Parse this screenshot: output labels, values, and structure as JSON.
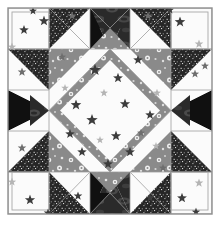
{
  "artwork": {
    "title": "Star Quilt Block",
    "kind": "quilt-block-diagram",
    "width": 220,
    "height": 227,
    "background": "#ffffff"
  },
  "frame": {
    "x": 8,
    "y": 8,
    "width": 204,
    "height": 206,
    "stroke": "#8e8e8e",
    "stroke_width": 1.4,
    "label": "outer-border"
  },
  "grid": {
    "columns": 5,
    "rows": 5,
    "cell_width": 40.8,
    "cell_height": 41.2,
    "origin_x": 8,
    "origin_y": 8,
    "seam_stroke": "#9a9a9a",
    "seam_width": 0.8
  },
  "palette": {
    "white_star_print": "#fbfbfb",
    "gray_floral_print": "#8a8a8a",
    "dark_speckle_print": "#2d2d2d",
    "black_solid": "#111111",
    "charcoal_swirl": "#3a3a3a",
    "seam_line": "#9a9a9a",
    "star_dark": "#3c3c3c",
    "star_mid": "#6e6e6e",
    "star_light": "#b4b4b4",
    "floral_dot": "#f2f2f2"
  },
  "fabrics": [
    {
      "id": "white_star",
      "name": "white-star-print",
      "fill": "#fbfbfb",
      "desc": "white background with scattered gray stars"
    },
    {
      "id": "gray_floral",
      "name": "gray-floral-print",
      "fill": "#8a8a8a",
      "desc": "medium gray with white flower sprigs"
    },
    {
      "id": "dark_speckle",
      "name": "dark-speckle-print",
      "fill": "#2d2d2d",
      "desc": "near-black with fine white speckles"
    },
    {
      "id": "black_solid",
      "name": "black-solid",
      "fill": "#111111",
      "desc": "solid black"
    },
    {
      "id": "charcoal_swirl",
      "name": "charcoal-swirl-print",
      "fill": "#3a3a3a",
      "desc": "dark charcoal with soft swirl highlights"
    }
  ],
  "center": {
    "name": "center-octagon",
    "fabric": "white_star",
    "note": "large white octagon formed by four star-point triangles"
  },
  "star_points": [
    {
      "position": "top",
      "fabric": "gray_floral"
    },
    {
      "position": "right",
      "fabric": "gray_floral"
    },
    {
      "position": "bottom",
      "fabric": "gray_floral"
    },
    {
      "position": "left",
      "fabric": "gray_floral"
    }
  ],
  "corner_blocks": [
    {
      "position": "top-left",
      "fabric": "white_star"
    },
    {
      "position": "top-right",
      "fabric": "white_star"
    },
    {
      "position": "bottom-left",
      "fabric": "white_star"
    },
    {
      "position": "bottom-right",
      "fabric": "white_star"
    }
  ],
  "edge_units": [
    {
      "position": "top-center",
      "type": "hourglass",
      "fabrics": [
        "black_solid",
        "charcoal_swirl",
        "gray_floral"
      ]
    },
    {
      "position": "bottom-center",
      "type": "hourglass",
      "fabrics": [
        "black_solid",
        "charcoal_swirl",
        "gray_floral"
      ]
    },
    {
      "position": "middle-left",
      "type": "hourglass",
      "fabrics": [
        "black_solid",
        "charcoal_swirl",
        "white_star"
      ]
    },
    {
      "position": "middle-right",
      "type": "hourglass",
      "fabrics": [
        "black_solid",
        "charcoal_swirl",
        "white_star"
      ]
    }
  ],
  "half_square_units": [
    {
      "position": "top-row-left",
      "fabrics": [
        "dark_speckle",
        "white_star"
      ]
    },
    {
      "position": "top-row-right",
      "fabrics": [
        "dark_speckle",
        "white_star"
      ]
    },
    {
      "position": "bottom-row-left",
      "fabrics": [
        "dark_speckle",
        "white_star"
      ]
    },
    {
      "position": "bottom-row-right",
      "fabrics": [
        "dark_speckle",
        "white_star"
      ]
    },
    {
      "position": "left-col-top",
      "fabrics": [
        "dark_speckle",
        "white_star"
      ]
    },
    {
      "position": "left-col-bottom",
      "fabrics": [
        "dark_speckle",
        "white_star"
      ]
    },
    {
      "position": "right-col-top",
      "fabrics": [
        "dark_speckle",
        "white_star"
      ]
    },
    {
      "position": "right-col-bottom",
      "fabrics": [
        "dark_speckle",
        "white_star"
      ]
    }
  ],
  "center_stars": [
    {
      "x": 95,
      "y": 70,
      "r": 6.2,
      "tone": "star_dark"
    },
    {
      "x": 118,
      "y": 78,
      "r": 5.2,
      "tone": "star_dark"
    },
    {
      "x": 138,
      "y": 60,
      "r": 5.0,
      "tone": "star_dark"
    },
    {
      "x": 104,
      "y": 93,
      "r": 4.2,
      "tone": "star_light"
    },
    {
      "x": 76,
      "y": 105,
      "r": 5.6,
      "tone": "star_dark"
    },
    {
      "x": 125,
      "y": 104,
      "r": 5.4,
      "tone": "star_dark"
    },
    {
      "x": 92,
      "y": 120,
      "r": 6.0,
      "tone": "star_dark"
    },
    {
      "x": 150,
      "y": 115,
      "r": 5.0,
      "tone": "star_dark"
    },
    {
      "x": 70,
      "y": 134,
      "r": 5.0,
      "tone": "star_dark"
    },
    {
      "x": 116,
      "y": 136,
      "r": 5.4,
      "tone": "star_dark"
    },
    {
      "x": 141,
      "y": 133,
      "r": 4.2,
      "tone": "star_mid"
    },
    {
      "x": 100,
      "y": 140,
      "r": 4.0,
      "tone": "star_light"
    },
    {
      "x": 82,
      "y": 152,
      "r": 5.0,
      "tone": "star_dark"
    },
    {
      "x": 130,
      "y": 152,
      "r": 5.2,
      "tone": "star_dark"
    },
    {
      "x": 108,
      "y": 164,
      "r": 5.2,
      "tone": "star_dark"
    },
    {
      "x": 65,
      "y": 88,
      "r": 4.0,
      "tone": "star_light"
    },
    {
      "x": 157,
      "y": 93,
      "r": 4.2,
      "tone": "star_light"
    },
    {
      "x": 156,
      "y": 146,
      "r": 4.0,
      "tone": "star_light"
    }
  ],
  "corner_stars": [
    {
      "x": 24,
      "y": 30,
      "r": 5.0,
      "tone": "star_dark"
    },
    {
      "x": 44,
      "y": 21,
      "r": 5.4,
      "tone": "star_dark"
    },
    {
      "x": 12,
      "y": 47,
      "r": 4.4,
      "tone": "star_light"
    },
    {
      "x": 33,
      "y": 11,
      "r": 4.2,
      "tone": "star_dark"
    },
    {
      "x": 180,
      "y": 22,
      "r": 5.6,
      "tone": "star_dark"
    },
    {
      "x": 199,
      "y": 44,
      "r": 4.6,
      "tone": "star_light"
    },
    {
      "x": 170,
      "y": 10,
      "r": 4.2,
      "tone": "star_dark"
    },
    {
      "x": 205,
      "y": 66,
      "r": 4.2,
      "tone": "star_mid"
    },
    {
      "x": 30,
      "y": 200,
      "r": 5.4,
      "tone": "star_dark"
    },
    {
      "x": 48,
      "y": 213,
      "r": 4.6,
      "tone": "star_dark"
    },
    {
      "x": 12,
      "y": 182,
      "r": 4.4,
      "tone": "star_light"
    },
    {
      "x": 182,
      "y": 198,
      "r": 5.2,
      "tone": "star_dark"
    },
    {
      "x": 199,
      "y": 183,
      "r": 4.6,
      "tone": "star_light"
    },
    {
      "x": 196,
      "y": 212,
      "r": 4.4,
      "tone": "star_dark"
    },
    {
      "x": 22,
      "y": 72,
      "r": 4.6,
      "tone": "star_mid"
    },
    {
      "x": 22,
      "y": 148,
      "r": 4.6,
      "tone": "star_mid"
    },
    {
      "x": 195,
      "y": 74,
      "r": 4.4,
      "tone": "star_mid"
    },
    {
      "x": 78,
      "y": 196,
      "r": 4.6,
      "tone": "star_dark"
    },
    {
      "x": 150,
      "y": 198,
      "r": 4.4,
      "tone": "star_dark"
    },
    {
      "x": 72,
      "y": 16,
      "r": 4.4,
      "tone": "star_mid"
    },
    {
      "x": 148,
      "y": 16,
      "r": 4.4,
      "tone": "star_mid"
    },
    {
      "x": 62,
      "y": 57,
      "r": 4.4,
      "tone": "star_mid"
    },
    {
      "x": 163,
      "y": 168,
      "r": 4.2,
      "tone": "star_mid"
    }
  ]
}
